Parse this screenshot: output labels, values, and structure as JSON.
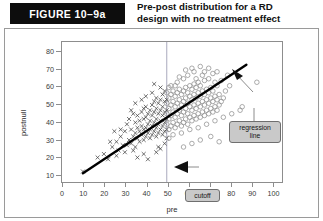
{
  "header": {
    "figure_label": "FIGURE 10–9a",
    "title": "Pre-post distribution for a RD\ndesign with no treatment effect"
  },
  "annotations": {
    "regression_line": "regression\nline",
    "cutoff": "cutoff"
  },
  "colors": {
    "label_bg": "#0d0d0d",
    "label_fg": "#ffffff",
    "frame": "#8d8d8d",
    "panel_border": "#9a9a9a",
    "regression_line": "#000000",
    "cutoff_line": "#9e9eb4",
    "marker_cross": "#3f3f3f",
    "marker_circle": "#8e8e8e",
    "callout_bg": "#c9c9c9",
    "callout_border": "#6f6f6f"
  },
  "chart_data": {
    "type": "scatter",
    "title": "Pre-post distribution for a RD design with no treatment effect",
    "xlabel": "pre",
    "ylabel": "postnull",
    "xlim": [
      0,
      105
    ],
    "ylim": [
      5,
      85
    ],
    "xticks": [
      0,
      10,
      20,
      30,
      40,
      50,
      60,
      70,
      80,
      90,
      100
    ],
    "yticks": [
      10,
      20,
      30,
      40,
      50,
      60,
      70,
      80
    ],
    "grid": false,
    "legend": null,
    "cutoff": {
      "x": 50,
      "label": "cutoff",
      "style": "vertical-line"
    },
    "regression": {
      "label": "regression line",
      "x": [
        10,
        88
      ],
      "y": [
        10,
        72
      ],
      "slope": 0.795,
      "intercept": 2.05,
      "note": "single continuous line across cutoff — no treatment effect"
    },
    "series": [
      {
        "name": "control (pre < 50)",
        "marker": "x",
        "color": "#3f3f3f",
        "points": [
          [
            10,
            11
          ],
          [
            17,
            19
          ],
          [
            20,
            21
          ],
          [
            22,
            18
          ],
          [
            24,
            25
          ],
          [
            25,
            34
          ],
          [
            26,
            28
          ],
          [
            27,
            23
          ],
          [
            28,
            31
          ],
          [
            29,
            26
          ],
          [
            30,
            22
          ],
          [
            30,
            34
          ],
          [
            31,
            38
          ],
          [
            32,
            29
          ],
          [
            32,
            41
          ],
          [
            33,
            27
          ],
          [
            33,
            35
          ],
          [
            34,
            31
          ],
          [
            34,
            44
          ],
          [
            35,
            25
          ],
          [
            35,
            33
          ],
          [
            35,
            39
          ],
          [
            36,
            30
          ],
          [
            36,
            36
          ],
          [
            36,
            43
          ],
          [
            37,
            28
          ],
          [
            37,
            34
          ],
          [
            37,
            40
          ],
          [
            38,
            32
          ],
          [
            38,
            37
          ],
          [
            38,
            45
          ],
          [
            39,
            29
          ],
          [
            39,
            35
          ],
          [
            39,
            41
          ],
          [
            39,
            47
          ],
          [
            40,
            31
          ],
          [
            40,
            36
          ],
          [
            40,
            42
          ],
          [
            40,
            48
          ],
          [
            41,
            33
          ],
          [
            41,
            38
          ],
          [
            41,
            44
          ],
          [
            42,
            30
          ],
          [
            42,
            35
          ],
          [
            42,
            40
          ],
          [
            42,
            46
          ],
          [
            43,
            32
          ],
          [
            43,
            37
          ],
          [
            43,
            43
          ],
          [
            43,
            49
          ],
          [
            44,
            34
          ],
          [
            44,
            39
          ],
          [
            44,
            45
          ],
          [
            44,
            51
          ],
          [
            45,
            31
          ],
          [
            45,
            36
          ],
          [
            45,
            41
          ],
          [
            45,
            47
          ],
          [
            45,
            53
          ],
          [
            46,
            33
          ],
          [
            46,
            38
          ],
          [
            46,
            44
          ],
          [
            46,
            50
          ],
          [
            47,
            35
          ],
          [
            47,
            40
          ],
          [
            47,
            46
          ],
          [
            47,
            52
          ],
          [
            48,
            32
          ],
          [
            48,
            37
          ],
          [
            48,
            43
          ],
          [
            48,
            48
          ],
          [
            48,
            55
          ],
          [
            49,
            34
          ],
          [
            49,
            39
          ],
          [
            49,
            45
          ],
          [
            49,
            51
          ],
          [
            49,
            57
          ],
          [
            36,
            19
          ],
          [
            39,
            21
          ],
          [
            41,
            18
          ],
          [
            34,
            23
          ],
          [
            31,
            26
          ],
          [
            28,
            35
          ],
          [
            26,
            20
          ],
          [
            23,
            28
          ],
          [
            35,
            50
          ],
          [
            38,
            52
          ],
          [
            33,
            46
          ],
          [
            43,
            56
          ],
          [
            47,
            59
          ],
          [
            44,
            61
          ],
          [
            40,
            54
          ],
          [
            46,
            25
          ],
          [
            49,
            27
          ],
          [
            50,
            30
          ],
          [
            50,
            35
          ],
          [
            50,
            41
          ],
          [
            50,
            46
          ],
          [
            50,
            52
          ],
          [
            47,
            24
          ],
          [
            45,
            22
          ]
        ]
      },
      {
        "name": "treatment (pre ≥ 50)",
        "marker": "o",
        "color": "#8e8e8e",
        "points": [
          [
            50,
            38
          ],
          [
            50,
            44
          ],
          [
            50,
            50
          ],
          [
            51,
            35
          ],
          [
            51,
            41
          ],
          [
            51,
            47
          ],
          [
            51,
            53
          ],
          [
            52,
            37
          ],
          [
            52,
            43
          ],
          [
            52,
            49
          ],
          [
            52,
            55
          ],
          [
            53,
            39
          ],
          [
            53,
            45
          ],
          [
            53,
            51
          ],
          [
            53,
            57
          ],
          [
            54,
            36
          ],
          [
            54,
            42
          ],
          [
            54,
            48
          ],
          [
            54,
            54
          ],
          [
            55,
            38
          ],
          [
            55,
            44
          ],
          [
            55,
            50
          ],
          [
            55,
            56
          ],
          [
            56,
            40
          ],
          [
            56,
            46
          ],
          [
            56,
            52
          ],
          [
            56,
            58
          ],
          [
            57,
            37
          ],
          [
            57,
            43
          ],
          [
            57,
            49
          ],
          [
            57,
            55
          ],
          [
            58,
            39
          ],
          [
            58,
            45
          ],
          [
            58,
            51
          ],
          [
            58,
            57
          ],
          [
            59,
            41
          ],
          [
            59,
            47
          ],
          [
            59,
            53
          ],
          [
            59,
            59
          ],
          [
            60,
            38
          ],
          [
            60,
            44
          ],
          [
            60,
            50
          ],
          [
            60,
            56
          ],
          [
            61,
            42
          ],
          [
            61,
            48
          ],
          [
            61,
            54
          ],
          [
            61,
            60
          ],
          [
            62,
            40
          ],
          [
            62,
            46
          ],
          [
            62,
            52
          ],
          [
            62,
            58
          ],
          [
            63,
            43
          ],
          [
            63,
            49
          ],
          [
            63,
            55
          ],
          [
            63,
            61
          ],
          [
            64,
            41
          ],
          [
            64,
            47
          ],
          [
            64,
            53
          ],
          [
            64,
            59
          ],
          [
            65,
            44
          ],
          [
            65,
            50
          ],
          [
            65,
            56
          ],
          [
            65,
            62
          ],
          [
            66,
            42
          ],
          [
            66,
            48
          ],
          [
            66,
            54
          ],
          [
            66,
            60
          ],
          [
            67,
            45
          ],
          [
            67,
            51
          ],
          [
            67,
            57
          ],
          [
            68,
            43
          ],
          [
            68,
            49
          ],
          [
            68,
            55
          ],
          [
            68,
            63
          ],
          [
            69,
            46
          ],
          [
            69,
            52
          ],
          [
            69,
            58
          ],
          [
            70,
            44
          ],
          [
            70,
            50
          ],
          [
            70,
            56
          ],
          [
            70,
            64
          ],
          [
            71,
            47
          ],
          [
            71,
            53
          ],
          [
            71,
            59
          ],
          [
            72,
            45
          ],
          [
            72,
            51
          ],
          [
            72,
            57
          ],
          [
            73,
            48
          ],
          [
            73,
            54
          ],
          [
            73,
            62
          ],
          [
            74,
            46
          ],
          [
            74,
            52
          ],
          [
            74,
            60
          ],
          [
            75,
            49
          ],
          [
            75,
            55
          ],
          [
            76,
            51
          ],
          [
            76,
            63
          ],
          [
            77,
            53
          ],
          [
            78,
            57
          ],
          [
            79,
            66
          ],
          [
            80,
            60
          ],
          [
            72,
            67
          ],
          [
            67,
            66
          ],
          [
            63,
            68
          ],
          [
            58,
            64
          ],
          [
            55,
            62
          ],
          [
            52,
            60
          ],
          [
            75,
            28
          ],
          [
            93,
            62
          ],
          [
            86,
            48
          ],
          [
            51,
            30
          ],
          [
            53,
            32
          ],
          [
            57,
            33
          ],
          [
            61,
            35
          ],
          [
            65,
            36
          ],
          [
            69,
            38
          ],
          [
            73,
            40
          ],
          [
            77,
            42
          ],
          [
            81,
            44
          ],
          [
            85,
            46
          ],
          [
            58,
            25
          ],
          [
            62,
            27
          ],
          [
            66,
            29
          ],
          [
            71,
            31
          ],
          [
            50,
            56
          ],
          [
            51,
            59
          ],
          [
            54,
            60
          ],
          [
            56,
            65
          ],
          [
            60,
            66
          ],
          [
            64,
            64
          ],
          [
            68,
            68
          ],
          [
            70,
            70
          ],
          [
            74,
            68
          ],
          [
            66,
            71
          ],
          [
            62,
            70
          ],
          [
            59,
            69
          ]
        ]
      }
    ]
  }
}
